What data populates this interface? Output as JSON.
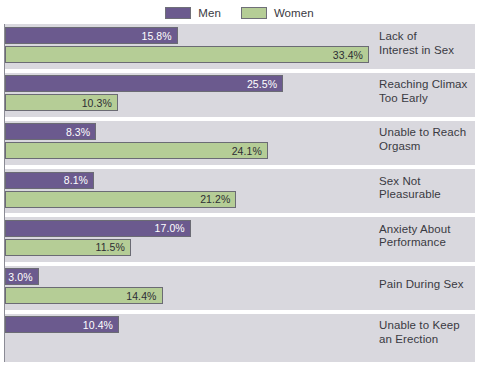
{
  "legend": {
    "entries": [
      {
        "label": "Men",
        "color": "#6b5a8e",
        "icon": "legend-swatch-men"
      },
      {
        "label": "Women",
        "color": "#b5cd96",
        "icon": "legend-swatch-women"
      }
    ]
  },
  "chart_data": {
    "type": "bar",
    "orientation": "horizontal",
    "title": "",
    "subtitle": "",
    "xlabel": "",
    "ylabel": "",
    "xlim": [
      0,
      34
    ],
    "grid": false,
    "legend_position": "top-center",
    "categories": [
      "Lack of Interest in Sex",
      "Reaching Climax Too Early",
      "Unable to Reach Orgasm",
      "Sex Not Pleasurable",
      "Anxiety About Performance",
      "Pain During Sex",
      "Unable to Keep an Erection"
    ],
    "category_lines": [
      [
        "Lack of",
        "Interest in Sex"
      ],
      [
        "Reaching Climax",
        "Too Early"
      ],
      [
        "Unable to Reach",
        "Orgasm"
      ],
      [
        "Sex Not",
        "Pleasurable"
      ],
      [
        "Anxiety About",
        "Performance"
      ],
      [
        "Pain During Sex"
      ],
      [
        "Unable to Keep",
        "an Erection"
      ]
    ],
    "series": [
      {
        "name": "Men",
        "color": "#6b5a8e",
        "values": [
          15.8,
          25.5,
          8.3,
          8.1,
          17.0,
          3.0,
          10.4
        ],
        "labels": [
          "15.8%",
          "25.5%",
          "8.3%",
          "8.1%",
          "17.0%",
          "3.0%",
          "10.4%"
        ]
      },
      {
        "name": "Women",
        "color": "#b5cd96",
        "values": [
          33.4,
          10.3,
          24.1,
          21.2,
          11.5,
          14.4,
          null
        ],
        "labels": [
          "33.4%",
          "10.3%",
          "24.1%",
          "21.2%",
          "11.5%",
          "14.4%",
          null
        ]
      }
    ]
  },
  "style": {
    "panel_background": "#d9d8de",
    "separator_color": "#ffffff",
    "text_color": "#3a3a42",
    "bar_border": "#6b6b74"
  }
}
